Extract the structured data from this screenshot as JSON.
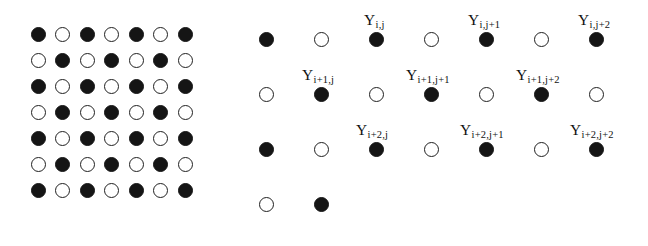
{
  "figure": {
    "background_color": "#ffffff",
    "filled_color": "#151515",
    "open_stroke_color": "#202020",
    "label_color": "#111111"
  },
  "left_lattice": {
    "name": "checkerboard-lattice",
    "rows": 7,
    "cols": 7,
    "origin_x": 38,
    "origin_y": 34,
    "spacing_x": 24.5,
    "spacing_y": 26.0,
    "diameter": 15,
    "pattern": [
      [
        "filled",
        "open",
        "filled",
        "open",
        "filled",
        "open",
        "filled"
      ],
      [
        "open",
        "filled",
        "open",
        "filled",
        "open",
        "filled",
        "open"
      ],
      [
        "filled",
        "open",
        "filled",
        "open",
        "filled",
        "open",
        "filled"
      ],
      [
        "open",
        "filled",
        "open",
        "filled",
        "open",
        "filled",
        "open"
      ],
      [
        "filled",
        "open",
        "filled",
        "open",
        "filled",
        "open",
        "filled"
      ],
      [
        "open",
        "filled",
        "open",
        "filled",
        "open",
        "filled",
        "open"
      ],
      [
        "filled",
        "open",
        "filled",
        "open",
        "filled",
        "open",
        "filled"
      ]
    ]
  },
  "right_lattice": {
    "name": "labeled-lattice",
    "origin_x": 266,
    "origin_y": 39,
    "spacing_x": 55.0,
    "spacing_y": 55.0,
    "diameter": 15,
    "pattern": [
      [
        "filled",
        "open",
        "filled",
        "open",
        "filled",
        "open",
        "filled"
      ],
      [
        "open",
        "filled",
        "open",
        "filled",
        "open",
        "filled",
        "open"
      ],
      [
        "filled",
        "open",
        "filled",
        "open",
        "filled",
        "open",
        "filled"
      ],
      [
        "open",
        "filled"
      ]
    ],
    "labels": [
      {
        "base": "Y",
        "sub": "i,j",
        "x": 364,
        "y": 12
      },
      {
        "base": "Y",
        "sub": "i,j+1",
        "x": 468,
        "y": 12
      },
      {
        "base": "Y",
        "sub": "i,j+2",
        "x": 578,
        "y": 12
      },
      {
        "base": "Y",
        "sub": "i+1,j",
        "x": 302,
        "y": 67
      },
      {
        "base": "Y",
        "sub": "i+1,j+1",
        "x": 406,
        "y": 67
      },
      {
        "base": "Y",
        "sub": "i+1,j+2",
        "x": 516,
        "y": 67
      },
      {
        "base": "Y",
        "sub": "i+2,j",
        "x": 356,
        "y": 122
      },
      {
        "base": "Y",
        "sub": "i+2,j+1",
        "x": 460,
        "y": 122
      },
      {
        "base": "Y",
        "sub": "i+2,j+2",
        "x": 570,
        "y": 122
      }
    ]
  }
}
